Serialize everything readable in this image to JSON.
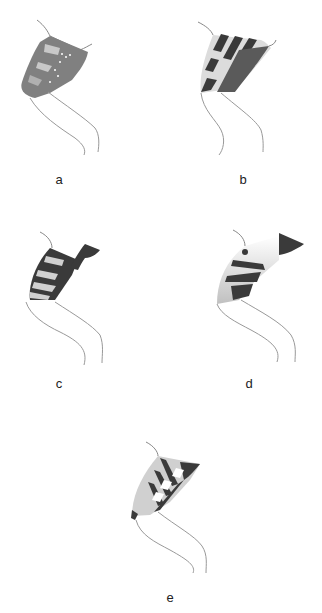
{
  "figure": {
    "panels": [
      {
        "id": "a",
        "label": "a",
        "description": "arm with gray patterned region with light patches and white dots"
      },
      {
        "id": "b",
        "label": "b",
        "description": "arm with dark/white stripes and stippled dark band"
      },
      {
        "id": "c",
        "label": "c",
        "description": "arm with dark stripes and light bands, dark shoulder flap"
      },
      {
        "id": "d",
        "label": "d",
        "description": "arm with light gradient region and irregular dark blotches, dark shoulder flap"
      },
      {
        "id": "e",
        "label": "e",
        "description": "arm with dark ladder-like stripes and light patches"
      }
    ],
    "colors": {
      "outline": "#888888",
      "dark": "#3a3a3a",
      "mid": "#7a7a7a",
      "light": "#c8c8c8",
      "background": "#ffffff"
    }
  }
}
